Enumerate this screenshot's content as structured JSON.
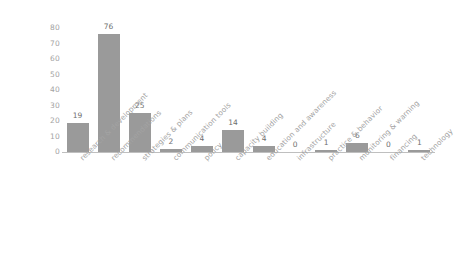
{
  "chart_data": {
    "type": "bar",
    "title": "",
    "subtitle": "",
    "xlabel": "",
    "ylabel": "",
    "ylim": [
      0,
      80
    ],
    "yticks": [
      0,
      10,
      20,
      30,
      40,
      50,
      60,
      70,
      80
    ],
    "grid": false,
    "legend": false,
    "bar_color": "#9a9a9a",
    "axis_color": "#bfbfbf",
    "label_color": "#a3a3a3",
    "value_label_color": "#6e6e6e",
    "categories": [
      "research & development",
      "recommendations",
      "strategies & plans",
      "communication tools",
      "policy",
      "capacity building",
      "education and awareness",
      "infrastructure",
      "practice & behavior",
      "monitoring & warning",
      "financing",
      "technology"
    ],
    "values": [
      19,
      76,
      25,
      2,
      4,
      14,
      4,
      0,
      1,
      6,
      0,
      1
    ],
    "value_labels": [
      "19",
      "76",
      "25",
      "2",
      "4",
      "14",
      "4",
      "0",
      "1",
      "6",
      "0",
      "1"
    ]
  }
}
